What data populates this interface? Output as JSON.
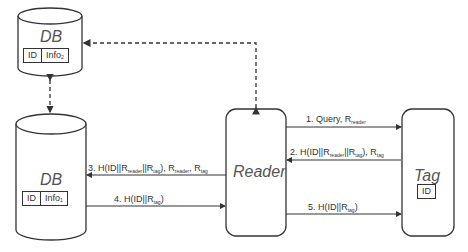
{
  "db_top": {
    "title": "DB",
    "fields": [
      "ID",
      "Info",
      "2"
    ]
  },
  "db_bottom": {
    "title": "DB",
    "fields": [
      "ID",
      "Info",
      "1"
    ]
  },
  "reader": {
    "title": "Reader"
  },
  "tag": {
    "title": "Tag",
    "field": "ID"
  },
  "messages": {
    "m1": {
      "pre": "1. Query, R",
      "sub1": "reader"
    },
    "m2": {
      "pre": "2. H(ID||R",
      "sub1": "reader",
      "mid": "||R",
      "sub2": "tag",
      "post": "), R",
      "sub3": "tag"
    },
    "m3": {
      "pre": "3. H(ID||R",
      "sub1": "reader",
      "mid": "||R",
      "sub2": "tag",
      "post": "), R",
      "sub3": "reader",
      "post2": ", R",
      "sub4": "tag"
    },
    "m4": {
      "pre": "4. H(ID||R",
      "sub1": "tag",
      "post": ")"
    },
    "m5": {
      "pre": "5. H(ID||R",
      "sub1": "tag",
      "post": ")"
    }
  }
}
